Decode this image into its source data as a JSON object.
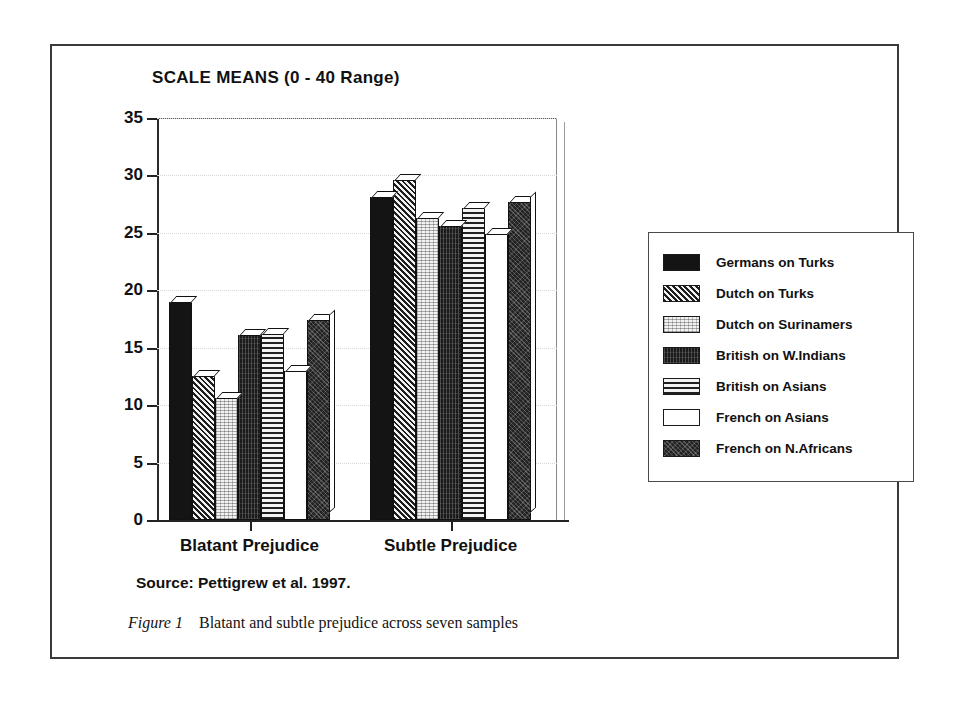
{
  "figure": {
    "frame_border_color": "#3a3a3a",
    "source_note": "Source: Pettigrew et al. 1997.",
    "caption_number": "Figure 1",
    "caption_text": "Blatant and subtle prejudice across seven samples"
  },
  "chart_data": {
    "type": "bar",
    "title": "SCALE MEANS (0 - 40 Range)",
    "xlabel": "",
    "ylabel": "",
    "ylim": [
      0,
      35
    ],
    "yticks": [
      0,
      5,
      10,
      15,
      20,
      25,
      30,
      35
    ],
    "ytick_labels": [
      "0",
      "5",
      "10",
      "15",
      "20",
      "25",
      "30",
      "35"
    ],
    "grid": false,
    "legend_position": "right",
    "categories": [
      "Blatant Prejudice",
      "Subtle Prejudice"
    ],
    "series": [
      {
        "name": "Germans on Turks",
        "pattern": "solid-black",
        "values": [
          19.0,
          28.1
        ]
      },
      {
        "name": "Dutch on Turks",
        "pattern": "diagonal",
        "values": [
          12.5,
          29.6
        ]
      },
      {
        "name": "Dutch on Surinamers",
        "pattern": "stipple-light",
        "values": [
          10.6,
          26.3
        ]
      },
      {
        "name": "British on W.Indians",
        "pattern": "dark-speckle",
        "values": [
          16.1,
          25.6
        ]
      },
      {
        "name": "British on Asians",
        "pattern": "horizontal",
        "values": [
          16.2,
          27.2
        ]
      },
      {
        "name": "French on Asians",
        "pattern": "white",
        "values": [
          13.0,
          24.9
        ]
      },
      {
        "name": "French on N.Africans",
        "pattern": "dark-stipple",
        "values": [
          17.4,
          27.7
        ]
      }
    ]
  }
}
